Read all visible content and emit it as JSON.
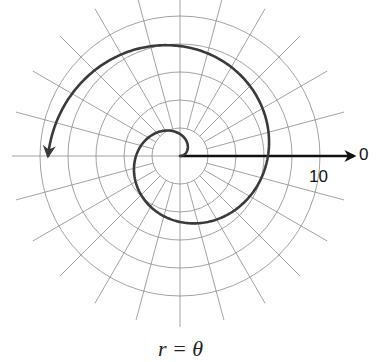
{
  "chart_data": {
    "type": "line",
    "subtype": "polar",
    "title": "",
    "caption": "r = θ",
    "equation": "r = theta",
    "theta_range_rad": [
      0,
      9.4248
    ],
    "r_axis": {
      "ring_values": [
        2,
        4,
        6,
        8,
        10
      ],
      "labeled_tick": "10",
      "max": 10
    },
    "angle_axis": {
      "radial_line_step_deg": 15,
      "zero_label": "0"
    },
    "series": [
      {
        "name": "r = θ",
        "direction": "counterclockwise",
        "end_arrow": true,
        "sample_points": [
          {
            "theta": 0,
            "r": 0
          },
          {
            "theta": 1.5708,
            "r": 1.5708
          },
          {
            "theta": 3.1416,
            "r": 3.1416
          },
          {
            "theta": 4.7124,
            "r": 4.7124
          },
          {
            "theta": 6.2832,
            "r": 6.2832
          },
          {
            "theta": 7.854,
            "r": 7.854
          },
          {
            "theta": 9.4248,
            "r": 9.4248
          }
        ]
      }
    ],
    "grid": true,
    "legend": "none"
  },
  "labels": {
    "zero": "0",
    "ten": "10",
    "caption": "r = θ"
  }
}
